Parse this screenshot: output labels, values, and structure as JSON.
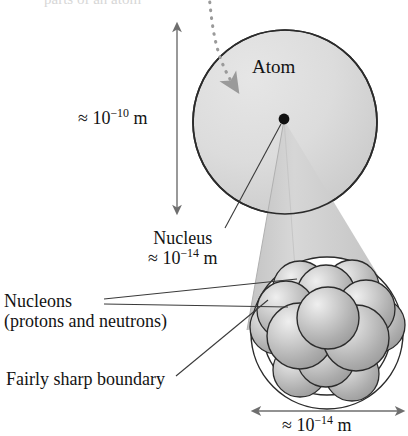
{
  "figure": {
    "title_cropped_top": "parts of an atom",
    "atom": {
      "label": "Atom",
      "size_prefix": "≈ 10",
      "size_exponent": "−10",
      "size_unit": " m",
      "size_full": "≈ 10−10 m",
      "fill_color": "#d8d8d8",
      "stroke_color": "#2b2b2b"
    },
    "incoming_arrow": {
      "name": "dotted-pointer-arrow",
      "style": "dotted",
      "color": "#9a9a9a"
    },
    "nucleus_dot": {
      "name": "nucleus-point",
      "color": "#111111"
    },
    "magnifier_cone": {
      "name": "zoom-cone",
      "fill_color": "#d2d2d2"
    },
    "nucleus": {
      "label": "Nucleus",
      "size_prefix": "≈ 10",
      "size_exponent": "−14",
      "size_unit": " m",
      "size_full": "≈ 10−14 m",
      "sphere_fill": "#b4b4b4",
      "sphere_highlight": "#f0f0f0",
      "stroke_color": "#2b2b2b",
      "nucleon_count": 13
    },
    "nucleons": {
      "label": "Nucleons",
      "sublabel": "(protons and neutrons)"
    },
    "boundary": {
      "label": "Fairly sharp boundary"
    },
    "bottom_dimension": {
      "prefix": "≈ 10",
      "exponent": "−14",
      "unit": " m",
      "full": "≈ 10−14 m"
    },
    "dimension_line_color": "#6e6e6e",
    "leader_line_color": "#3a3a3a"
  }
}
